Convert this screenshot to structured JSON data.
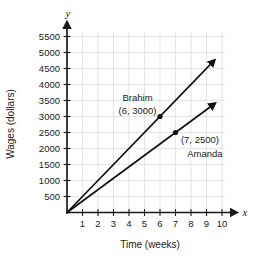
{
  "chart_data": {
    "type": "line",
    "title": "",
    "subtitle": "",
    "xlabel": "Time (weeks)",
    "ylabel": "Wages (dollars)",
    "x_axis_letter": "x",
    "y_axis_letter": "y",
    "xlim": [
      0,
      10
    ],
    "ylim": [
      0,
      5750
    ],
    "x_ticks": [
      1,
      2,
      3,
      4,
      5,
      6,
      7,
      8,
      9,
      10
    ],
    "x_tick_labels": [
      "1",
      "2",
      "3",
      "4",
      "5",
      "6",
      "7",
      "8",
      "9",
      "10"
    ],
    "y_ticks": [
      500,
      1000,
      1500,
      2000,
      2500,
      3000,
      3500,
      4000,
      4500,
      5000,
      5500
    ],
    "y_tick_labels": [
      "500",
      "1000",
      "1500",
      "2000",
      "2500",
      "3000",
      "3500",
      "4000",
      "4500",
      "5000",
      "5500"
    ],
    "grid": true,
    "legend": "none",
    "series": [
      {
        "name": "Brahim",
        "slope": 500,
        "x": [
          0,
          9.3
        ],
        "values": [
          0,
          4650
        ],
        "arrow_end": true,
        "marker_point": {
          "x": 6,
          "y": 3000,
          "label": "(6, 3000)"
        },
        "name_label": "Brahim",
        "coord_label": "(6, 3000)"
      },
      {
        "name": "Amanda",
        "slope": 357.14,
        "x": [
          0,
          9.3
        ],
        "values": [
          0,
          3321
        ],
        "arrow_end": true,
        "marker_point": {
          "x": 7,
          "y": 2500,
          "label": "(7, 2500)"
        },
        "name_label": "Amanda",
        "coord_label": "(7, 2500)"
      }
    ],
    "annotations": [
      {
        "text": "Brahim",
        "x": 4.55,
        "y": 3480
      },
      {
        "text": "(6, 3000)",
        "x": 4.55,
        "y": 3085
      },
      {
        "text": "(7, 2500)",
        "x": 7.35,
        "y": 2180
      },
      {
        "text": "Amanda",
        "x": 7.75,
        "y": 1750
      }
    ],
    "colors": {
      "background": "#ffffff",
      "grid": "#d9d9d9",
      "axis": "#1a1a1a",
      "series_line": "#111111",
      "text": "#1a1a1a"
    }
  }
}
